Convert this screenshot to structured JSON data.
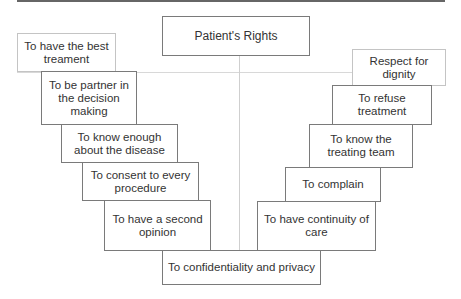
{
  "diagram": {
    "title": "Patient's Rights",
    "left_branch": [
      {
        "label": "To have the best treament"
      },
      {
        "label": "To be partner in the decision making"
      },
      {
        "label": "To know enough about the disease"
      },
      {
        "label": "To consent to every procedure"
      },
      {
        "label": "To have a second opinion"
      }
    ],
    "right_branch": [
      {
        "label": "Respect for dignity"
      },
      {
        "label": "To refuse treatment"
      },
      {
        "label": "To know the treating team"
      },
      {
        "label": "To complain"
      },
      {
        "label": "To have continuity of care"
      }
    ],
    "bottom": {
      "label": "To confidentiality and privacy"
    }
  }
}
